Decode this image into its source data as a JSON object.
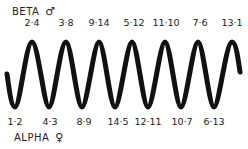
{
  "top_group": {
    "title": "BETA",
    "symbol": "♂",
    "labels": [
      "2·4",
      "3·8",
      "9·14",
      "5·12",
      "11·10",
      "7·6",
      "13·1"
    ]
  },
  "bottom_group": {
    "title": "ALPHA",
    "symbol": "♀",
    "labels": [
      "1·2",
      "4·3",
      "8·9",
      "14·5",
      "12·11",
      "10·7",
      "6·13"
    ]
  },
  "wave": {
    "color": "#111111",
    "peaks": 7,
    "troughs": 7
  }
}
